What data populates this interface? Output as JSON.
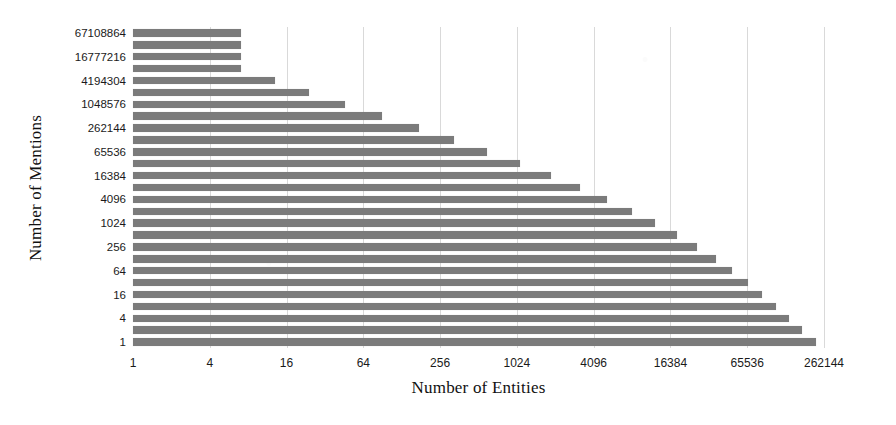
{
  "chart_data": {
    "type": "bar",
    "orientation": "horizontal",
    "title": "",
    "xlabel": "Number of Entities",
    "ylabel": "Number of Mentions",
    "xscale": "log",
    "yscale": "log",
    "xlim": [
      1,
      262144
    ],
    "ylim": [
      1,
      67108864
    ],
    "grid": true,
    "legend": "none",
    "bar_color": "#7b7b7b",
    "x_tick_labels": [
      "1",
      "4",
      "16",
      "64",
      "256",
      "1024",
      "4096",
      "16384",
      "65536",
      "262144"
    ],
    "x_tick_values": [
      1,
      4,
      16,
      64,
      256,
      1024,
      4096,
      16384,
      65536,
      262144
    ],
    "y_tick_labels": [
      "1",
      "4",
      "16",
      "64",
      "256",
      "1024",
      "4096",
      "16384",
      "65536",
      "262144",
      "1048576",
      "4194304",
      "16777216",
      "67108864"
    ],
    "y_tick_values": [
      1,
      4,
      16,
      64,
      256,
      1024,
      4096,
      16384,
      65536,
      262144,
      1048576,
      4194304,
      16777216,
      67108864
    ],
    "categories": [
      1,
      2,
      4,
      8,
      16,
      32,
      64,
      128,
      256,
      512,
      1024,
      2048,
      4096,
      8192,
      16384,
      32768,
      65536,
      131072,
      262144,
      524288,
      1048576,
      2097152,
      4194304,
      8388608,
      16777216,
      33554432,
      67108864
    ],
    "category_labels": [
      "1",
      "2",
      "4",
      "8",
      "16",
      "32",
      "64",
      "128",
      "256",
      "512",
      "1024",
      "2048",
      "4096",
      "8192",
      "16384",
      "32768",
      "65536",
      "131072",
      "262144",
      "524288",
      "1048576",
      "2097152",
      "4194304",
      "8388608",
      "16777216",
      "33554432",
      "67108864"
    ],
    "values": [
      225000,
      176000,
      140000,
      110000,
      86000,
      66000,
      50000,
      37000,
      26500,
      18500,
      12500,
      8200,
      5200,
      3200,
      1900,
      1080,
      600,
      330,
      175,
      90,
      46,
      24,
      13,
      7,
      7,
      7,
      7
    ]
  },
  "axes": {
    "x_title": "Number of Entities",
    "y_title": "Number of Mentions"
  }
}
